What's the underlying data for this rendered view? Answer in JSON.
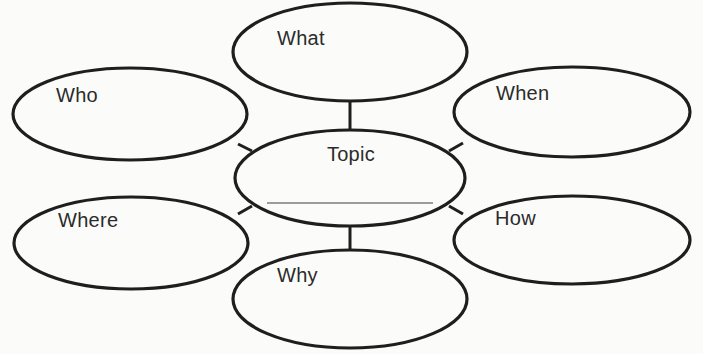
{
  "diagram": {
    "type": "concept-map",
    "background_color": "#fbfbfa",
    "stroke_color": "#1e1e1e",
    "text_color": "#2b2b2b",
    "stroke_width": 3,
    "canvas": {
      "width": 703,
      "height": 354
    },
    "center_node": {
      "id": "topic",
      "label": "Topic",
      "cx": 350,
      "cy": 178,
      "rx": 115,
      "ry": 48,
      "has_blank_line": true,
      "blank_line": {
        "x1": 267,
        "x2": 433,
        "y": 203,
        "width": 1
      }
    },
    "nodes": [
      {
        "id": "what",
        "label": "What",
        "cx": 350,
        "cy": 52,
        "rx": 117,
        "ry": 49
      },
      {
        "id": "who",
        "label": "Who",
        "cx": 130,
        "cy": 114,
        "rx": 117,
        "ry": 46
      },
      {
        "id": "when",
        "label": "When",
        "cx": 572,
        "cy": 112,
        "rx": 118,
        "ry": 45
      },
      {
        "id": "where",
        "label": "Where",
        "cx": 131,
        "cy": 243,
        "rx": 117,
        "ry": 46
      },
      {
        "id": "how",
        "label": "How",
        "cx": 572,
        "cy": 240,
        "rx": 118,
        "ry": 44
      },
      {
        "id": "why",
        "label": "Why",
        "cx": 350,
        "cy": 299,
        "rx": 117,
        "ry": 49
      }
    ],
    "connectors": [
      {
        "id": "topic-what",
        "from": "topic",
        "to": "what",
        "x1": 350,
        "y1": 131,
        "x2": 350,
        "y2": 101
      },
      {
        "id": "topic-who",
        "from": "topic",
        "to": "who",
        "x1": 252,
        "y1": 151,
        "x2": 238,
        "y2": 144
      },
      {
        "id": "topic-when",
        "from": "topic",
        "to": "when",
        "x1": 449,
        "y1": 151,
        "x2": 463,
        "y2": 143
      },
      {
        "id": "topic-where",
        "from": "topic",
        "to": "where",
        "x1": 252,
        "y1": 206,
        "x2": 238,
        "y2": 214
      },
      {
        "id": "topic-how",
        "from": "topic",
        "to": "how",
        "x1": 449,
        "y1": 206,
        "x2": 463,
        "y2": 214
      },
      {
        "id": "topic-why",
        "from": "topic",
        "to": "why",
        "x1": 350,
        "y1": 226,
        "x2": 350,
        "y2": 251
      }
    ]
  }
}
